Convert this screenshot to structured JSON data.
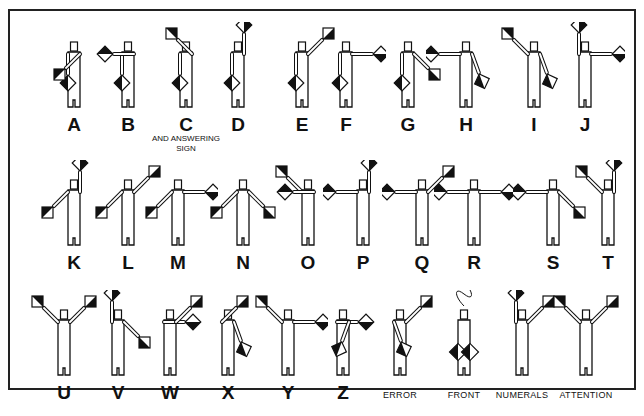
{
  "colors": {
    "ink": "#111111",
    "flag_dark": "#111111",
    "flag_light": "#ffffff",
    "frame": "#222222"
  },
  "signals": [
    {
      "label": "A",
      "arms": [
        "down",
        "low-left"
      ],
      "x": 34,
      "y": 22
    },
    {
      "label": "B",
      "arms": [
        "down",
        "left"
      ],
      "x": 88,
      "y": 22
    },
    {
      "label": "C",
      "arms": [
        "down",
        "high-left"
      ],
      "sublabel": "AND ANSWERING SIGN",
      "x": 146,
      "y": 22
    },
    {
      "label": "D",
      "arms": [
        "down",
        "up"
      ],
      "x": 198,
      "y": 22
    },
    {
      "label": "E",
      "arms": [
        "down",
        "high-right"
      ],
      "x": 262,
      "y": 22
    },
    {
      "label": "F",
      "arms": [
        "down",
        "right"
      ],
      "x": 306,
      "y": 22
    },
    {
      "label": "G",
      "arms": [
        "down",
        "low-right"
      ],
      "x": 368,
      "y": 22
    },
    {
      "label": "H",
      "arms": [
        "left",
        "across-low"
      ],
      "x": 426,
      "y": 22
    },
    {
      "label": "I",
      "arms": [
        "high-left",
        "across-low"
      ],
      "x": 494,
      "y": 22
    },
    {
      "label": "J",
      "arms": [
        "up",
        "right"
      ],
      "x": 545,
      "y": 22
    },
    {
      "label": "K",
      "arms": [
        "low-left",
        "up"
      ],
      "x": 34,
      "y": 160
    },
    {
      "label": "L",
      "arms": [
        "low-left",
        "high-right"
      ],
      "x": 88,
      "y": 160
    },
    {
      "label": "M",
      "arms": [
        "low-left",
        "right"
      ],
      "x": 138,
      "y": 160
    },
    {
      "label": "N",
      "arms": [
        "low-left",
        "low-right"
      ],
      "x": 203,
      "y": 160
    },
    {
      "label": "O",
      "arms": [
        "high-left",
        "left"
      ],
      "x": 268,
      "y": 160
    },
    {
      "label": "P",
      "arms": [
        "left",
        "up"
      ],
      "x": 323,
      "y": 160
    },
    {
      "label": "Q",
      "arms": [
        "left",
        "high-right"
      ],
      "x": 382,
      "y": 160
    },
    {
      "label": "R",
      "arms": [
        "left",
        "right"
      ],
      "x": 434,
      "y": 160
    },
    {
      "label": "S",
      "arms": [
        "left",
        "low-right"
      ],
      "x": 513,
      "y": 160
    },
    {
      "label": "T",
      "arms": [
        "high-left",
        "up"
      ],
      "x": 568,
      "y": 160
    },
    {
      "label": "U",
      "arms": [
        "high-left",
        "high-right"
      ],
      "x": 24,
      "y": 290
    },
    {
      "label": "V",
      "arms": [
        "up",
        "low-right"
      ],
      "x": 78,
      "y": 290
    },
    {
      "label": "W",
      "arms": [
        "right",
        "high-right"
      ],
      "x": 130,
      "y": 290
    },
    {
      "label": "X",
      "arms": [
        "high-right",
        "across-low"
      ],
      "x": 188,
      "y": 290
    },
    {
      "label": "Y",
      "arms": [
        "high-left",
        "right"
      ],
      "x": 248,
      "y": 290
    },
    {
      "label": "Z",
      "arms": [
        "right",
        "across-low-r"
      ],
      "x": 303,
      "y": 290
    },
    {
      "label": "ERROR",
      "arms": [
        "across-low",
        "high-right"
      ],
      "small": true,
      "x": 360,
      "y": 290
    },
    {
      "label": "FRONT",
      "arms": [
        "front",
        "front"
      ],
      "small": true,
      "loop": true,
      "x": 424,
      "y": 290
    },
    {
      "label": "NUMERALS",
      "arms": [
        "up",
        "high-right"
      ],
      "small": true,
      "x": 482,
      "y": 290
    },
    {
      "label": "ATTENTION",
      "arms": [
        "high-left",
        "high-right"
      ],
      "small": true,
      "arrows": true,
      "x": 546,
      "y": 290
    }
  ]
}
